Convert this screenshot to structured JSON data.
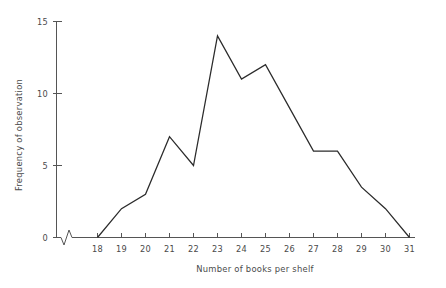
{
  "chart_data": {
    "type": "line",
    "title": "",
    "xlabel": "Number of books per shelf",
    "ylabel": "Frequency of observation",
    "x": [
      18,
      19,
      20,
      21,
      22,
      23,
      24,
      25,
      26,
      27,
      28,
      29,
      30,
      31
    ],
    "values": [
      0,
      2,
      3,
      7,
      5,
      14,
      11,
      12,
      9,
      6,
      6,
      3.5,
      2,
      0
    ],
    "series": [
      {
        "name": "Frequency of observation",
        "values": [
          0,
          2,
          3,
          7,
          5,
          14,
          11,
          12,
          9,
          6,
          6,
          3.5,
          2,
          0
        ]
      }
    ],
    "xlim": [
      18,
      31
    ],
    "ylim": [
      0,
      15
    ],
    "xticks": [
      18,
      19,
      20,
      21,
      22,
      23,
      24,
      25,
      26,
      27,
      28,
      29,
      30,
      31
    ],
    "xtick_labels": [
      "18",
      "19",
      "20",
      "21",
      "22",
      "23",
      "24",
      "25",
      "26",
      "27",
      "28",
      "29",
      "30",
      "31"
    ],
    "yticks": [
      0,
      5,
      10,
      15
    ],
    "ytick_labels": [
      "0",
      "5",
      "10",
      "15"
    ],
    "grid": false,
    "legend": false,
    "legend_position": "none",
    "axis_break": "x-axis zigzag break between origin and first category",
    "line_color": "#2b2b2b",
    "axis_color": "#555555",
    "background_color": "#ffffff"
  }
}
